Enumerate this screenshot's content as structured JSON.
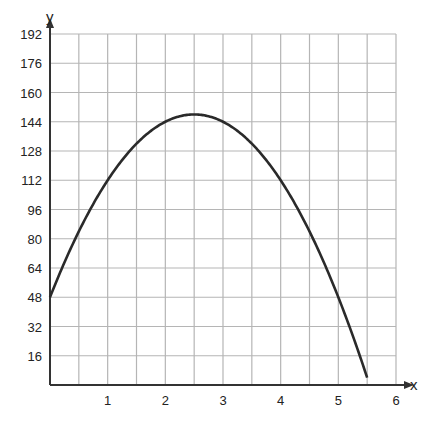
{
  "chart_data": {
    "type": "line",
    "title": "",
    "xlabel": "x",
    "ylabel": "y",
    "xlim": [
      0,
      6
    ],
    "ylim": [
      0,
      192
    ],
    "x_ticks": [
      "1",
      "2",
      "3",
      "4",
      "5",
      "6"
    ],
    "y_ticks": [
      "16",
      "32",
      "48",
      "64",
      "80",
      "96",
      "112",
      "128",
      "144",
      "160",
      "176",
      "192"
    ],
    "grid": true,
    "grid_x_step": 0.5,
    "grid_y_step": 16,
    "legend": null,
    "series": [
      {
        "name": "y = -16x^2 + 80x + 48",
        "x": [
          0,
          0.5,
          1,
          1.5,
          2,
          2.5,
          3,
          3.5,
          4,
          4.5,
          5,
          5.5
        ],
        "values": [
          48,
          84,
          112,
          132,
          144,
          148,
          144,
          132,
          112,
          84,
          48,
          0
        ]
      }
    ]
  },
  "labels": {
    "x_axis": "x",
    "y_axis": "y"
  },
  "colors": {
    "grid": "#b5b5b5",
    "axis": "#333333",
    "curve": "#2a2a2a"
  }
}
